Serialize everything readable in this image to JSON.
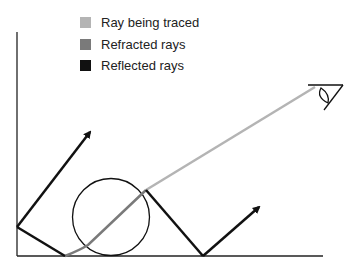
{
  "legend": {
    "items": [
      {
        "label": "Ray being traced",
        "color": "#b4b4b4"
      },
      {
        "label": "Refracted rays",
        "color": "#7a7a7a"
      },
      {
        "label": "Reflected rays",
        "color": "#111111"
      }
    ]
  },
  "diagram": {
    "elements": [
      "wall-line",
      "floor-line",
      "sphere",
      "eye",
      "traced-ray",
      "refracted-ray",
      "reflected-rays"
    ]
  }
}
